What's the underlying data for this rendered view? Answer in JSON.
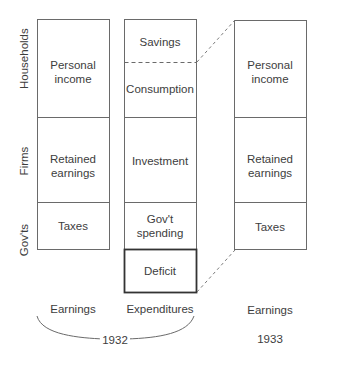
{
  "axis_labels": {
    "households": "Households",
    "firms": "Firms",
    "govts": "Gov'ts"
  },
  "column_1932_earnings": {
    "personal_income": "Personal income",
    "retained_earnings": "Retained earnings",
    "taxes": "Taxes",
    "caption": "Earnings"
  },
  "column_1932_expenditures": {
    "savings": "Savings",
    "consumption": "Consumption",
    "investment": "Investment",
    "govt_spending": "Gov't spending",
    "deficit": "Deficit",
    "caption": "Expenditures"
  },
  "column_1933_earnings": {
    "personal_income": "Personal income",
    "retained_earnings": "Retained earnings",
    "taxes": "Taxes",
    "caption": "Earnings"
  },
  "years": {
    "y1932": "1932",
    "y1933": "1933"
  }
}
